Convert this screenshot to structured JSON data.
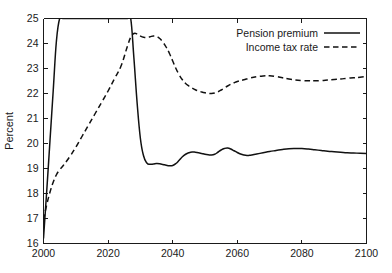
{
  "chart_data": {
    "type": "line",
    "title": "",
    "subtitle": "",
    "xlabel": "",
    "ylabel": "Percent",
    "xlim": [
      2000,
      2100
    ],
    "ylim": [
      16,
      25
    ],
    "xticks": [
      2000,
      2020,
      2040,
      2060,
      2080,
      2100
    ],
    "xticklabels": [
      "2000",
      "2020",
      "2040",
      "2060",
      "2080",
      "2100"
    ],
    "yticks": [
      16,
      17,
      18,
      19,
      20,
      21,
      22,
      23,
      24,
      25
    ],
    "yticklabels": [
      "16",
      "17",
      "18",
      "19",
      "20",
      "21",
      "22",
      "23",
      "24",
      "25"
    ],
    "grid": false,
    "legend_position": "top-right",
    "note": "Pension premium is clipped at the top of the axis (25) between roughly 2005 and 2027.",
    "series": [
      {
        "name": "Pension premium",
        "style": "solid",
        "color": "#111111",
        "x": [
          2000,
          2001,
          2002,
          2003,
          2004,
          2005,
          2006,
          2010,
          2015,
          2020,
          2024,
          2026,
          2027,
          2028,
          2029,
          2030,
          2031,
          2032,
          2033,
          2034,
          2035,
          2036,
          2037,
          2038,
          2039,
          2040,
          2041,
          2042,
          2043,
          2044,
          2045,
          2046,
          2047,
          2048,
          2049,
          2050,
          2051,
          2052,
          2053,
          2054,
          2055,
          2056,
          2057,
          2058,
          2059,
          2060,
          2061,
          2062,
          2063,
          2064,
          2066,
          2068,
          2070,
          2072,
          2074,
          2076,
          2078,
          2080,
          2082,
          2084,
          2086,
          2088,
          2090,
          2092,
          2094,
          2096,
          2098,
          2100
        ],
        "y": [
          16.2,
          18.1,
          20.1,
          22.1,
          24.1,
          25.0,
          25.0,
          25.0,
          25.0,
          25.0,
          25.0,
          25.0,
          25.0,
          23.4,
          21.6,
          20.2,
          19.5,
          19.22,
          19.17,
          19.18,
          19.2,
          19.19,
          19.16,
          19.13,
          19.11,
          19.12,
          19.2,
          19.33,
          19.47,
          19.57,
          19.63,
          19.66,
          19.65,
          19.63,
          19.6,
          19.57,
          19.55,
          19.54,
          19.57,
          19.65,
          19.74,
          19.8,
          19.82,
          19.78,
          19.71,
          19.64,
          19.58,
          19.54,
          19.52,
          19.53,
          19.58,
          19.63,
          19.68,
          19.72,
          19.76,
          19.79,
          19.8,
          19.8,
          19.78,
          19.75,
          19.72,
          19.69,
          19.67,
          19.65,
          19.63,
          19.62,
          19.61,
          19.6
        ]
      },
      {
        "name": "Income tax rate",
        "style": "dashed",
        "color": "#111111",
        "x": [
          2000,
          2001,
          2002,
          2003,
          2004,
          2005,
          2006,
          2008,
          2010,
          2012,
          2014,
          2016,
          2018,
          2020,
          2022,
          2024,
          2026,
          2027,
          2028,
          2029,
          2030,
          2031,
          2032,
          2033,
          2034,
          2035,
          2036,
          2037,
          2038,
          2039,
          2040,
          2041,
          2042,
          2043,
          2044,
          2045,
          2046,
          2047,
          2048,
          2049,
          2050,
          2051,
          2052,
          2053,
          2054,
          2055,
          2056,
          2057,
          2058,
          2059,
          2060,
          2062,
          2064,
          2066,
          2068,
          2070,
          2072,
          2074,
          2076,
          2078,
          2080,
          2082,
          2084,
          2086,
          2088,
          2090,
          2092,
          2094,
          2096,
          2098,
          2100
        ],
        "y": [
          16.95,
          17.55,
          18.05,
          18.45,
          18.75,
          18.95,
          19.1,
          19.45,
          19.85,
          20.3,
          20.75,
          21.2,
          21.65,
          22.1,
          22.6,
          23.1,
          23.9,
          24.25,
          24.4,
          24.38,
          24.3,
          24.25,
          24.24,
          24.27,
          24.3,
          24.28,
          24.2,
          24.05,
          23.85,
          23.6,
          23.3,
          23.0,
          22.75,
          22.55,
          22.4,
          22.3,
          22.22,
          22.15,
          22.1,
          22.06,
          22.03,
          22.01,
          22.0,
          22.02,
          22.07,
          22.14,
          22.22,
          22.3,
          22.37,
          22.43,
          22.48,
          22.55,
          22.62,
          22.67,
          22.7,
          22.71,
          22.68,
          22.63,
          22.58,
          22.54,
          22.52,
          22.51,
          22.51,
          22.52,
          22.54,
          22.56,
          22.58,
          22.61,
          22.63,
          22.65,
          22.68
        ]
      }
    ]
  },
  "legend": {
    "items": [
      {
        "label": "Pension premium",
        "style": "solid"
      },
      {
        "label": "Income tax rate",
        "style": "dashed"
      }
    ]
  },
  "axes": {
    "ylabel": "Percent"
  }
}
